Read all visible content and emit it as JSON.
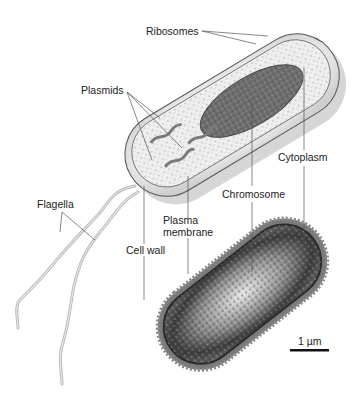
{
  "diagram": {
    "labels": {
      "ribosomes": "Ribosomes",
      "plasmids": "Plasmids",
      "cytoplasm": "Cytoplasm",
      "chromosome": "Chromosome",
      "flagella": "Flagella",
      "plasma_membrane_line1": "Plasma",
      "plasma_membrane_line2": "membrane",
      "cell_wall": "Cell wall"
    },
    "scale_bar": {
      "label": "1 µm"
    },
    "colors": {
      "cell_fill": "#e9e9e9",
      "chromosome": "#6e6e6e",
      "micrograph_dark": "#3a3a3a",
      "leader_lines": "#555555"
    }
  }
}
